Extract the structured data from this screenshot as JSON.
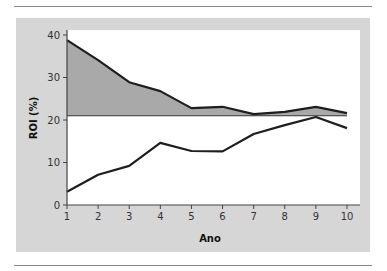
{
  "chart_data": {
    "type": "line",
    "title": "",
    "xlabel": "Ano",
    "ylabel": "ROI (%)",
    "x": [
      1,
      2,
      3,
      4,
      5,
      6,
      7,
      8,
      9,
      10
    ],
    "xlim": [
      1,
      10
    ],
    "ylim": [
      0,
      40
    ],
    "xticks": [
      1,
      2,
      3,
      4,
      5,
      6,
      7,
      8,
      9,
      10
    ],
    "yticks": [
      0,
      10,
      20,
      30,
      40
    ],
    "reference_line": 21,
    "grid": false,
    "legend": null,
    "series": [
      {
        "name": "upper",
        "values": [
          38.8,
          34.1,
          28.9,
          26.8,
          22.8,
          23.1,
          21.4,
          21.9,
          23.1,
          21.6
        ],
        "fill_to_reference": true
      },
      {
        "name": "lower",
        "values": [
          3.1,
          7.1,
          9.2,
          14.6,
          12.7,
          12.6,
          16.7,
          18.8,
          20.7,
          18.1
        ]
      }
    ]
  },
  "colors": {
    "panel": "#d6d6d6",
    "plot_bg": "#ffffff",
    "fill": "#a9a9a9",
    "line": "#1e1e1e",
    "axis": "#444444"
  }
}
